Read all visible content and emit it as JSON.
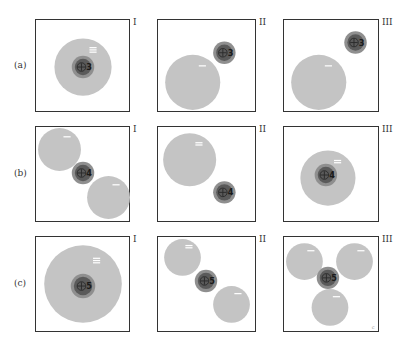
{
  "figure": {
    "colors": {
      "anion_fill": "#c4c4c4",
      "cation_halo": "#8f8f8f",
      "cation_core": "#5a5a5a",
      "cation_ring": "#2a2a2a",
      "charge_mark": "#ffffff",
      "border": "#333333"
    },
    "column_labels": [
      "I",
      "II",
      "III"
    ],
    "rows": [
      {
        "label": "(a)",
        "cation_charge": "3",
        "panels": [
          {
            "col": "I",
            "anions": [
              {
                "cx": 47,
                "cy": 47,
                "r": 28,
                "mark": "≡"
              }
            ],
            "cation": {
              "cx": 47,
              "cy": 47,
              "halo": 11,
              "core": 8
            }
          },
          {
            "col": "II",
            "anions": [
              {
                "cx": 35,
                "cy": 62,
                "r": 27,
                "mark": "−"
              }
            ],
            "cation": {
              "cx": 66,
              "cy": 33,
              "halo": 11,
              "core": 8
            }
          },
          {
            "col": "III",
            "anions": [
              {
                "cx": 35,
                "cy": 62,
                "r": 27,
                "mark": "−"
              }
            ],
            "cation": {
              "cx": 71,
              "cy": 23,
              "halo": 11,
              "core": 8
            }
          }
        ]
      },
      {
        "label": "(b)",
        "cation_charge": "4",
        "panels": [
          {
            "col": "I",
            "anions": [
              {
                "cx": 24,
                "cy": 23,
                "r": 21,
                "mark": "−"
              },
              {
                "cx": 72,
                "cy": 70,
                "r": 21,
                "mark": "−"
              }
            ],
            "cation": {
              "cx": 47,
              "cy": 46,
              "halo": 11,
              "core": 8
            }
          },
          {
            "col": "II",
            "anions": [
              {
                "cx": 32,
                "cy": 33,
                "r": 26,
                "mark": "="
              }
            ],
            "cation": {
              "cx": 66,
              "cy": 65,
              "halo": 11,
              "core": 8
            }
          },
          {
            "col": "III",
            "anions": [
              {
                "cx": 44,
                "cy": 51,
                "r": 27,
                "mark": "="
              }
            ],
            "cation": {
              "cx": 42,
              "cy": 48,
              "halo": 11,
              "core": 8
            }
          }
        ]
      },
      {
        "label": "(c)",
        "cation_charge": "5",
        "panels": [
          {
            "col": "I",
            "anions": [
              {
                "cx": 47,
                "cy": 47,
                "r": 38,
                "mark": "≡"
              }
            ],
            "cation": {
              "cx": 47,
              "cy": 49,
              "halo": 12,
              "core": 9
            }
          },
          {
            "col": "II",
            "anions": [
              {
                "cx": 25,
                "cy": 21,
                "r": 18,
                "mark": "="
              },
              {
                "cx": 73,
                "cy": 67,
                "r": 18,
                "mark": "−"
              }
            ],
            "cation": {
              "cx": 48,
              "cy": 44,
              "halo": 11,
              "core": 8
            }
          },
          {
            "col": "III",
            "anions": [
              {
                "cx": 21,
                "cy": 25,
                "r": 18,
                "mark": "−"
              },
              {
                "cx": 70,
                "cy": 25,
                "r": 18,
                "mark": "−"
              },
              {
                "cx": 46,
                "cy": 70,
                "r": 18,
                "mark": "−"
              }
            ],
            "cation": {
              "cx": 44,
              "cy": 41,
              "halo": 11,
              "core": 8
            }
          }
        ]
      }
    ],
    "corner_mark": "c"
  }
}
